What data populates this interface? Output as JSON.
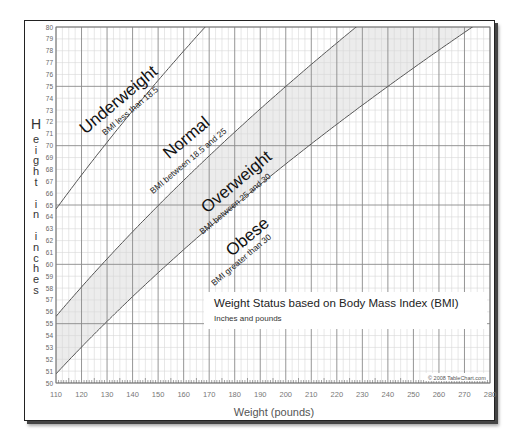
{
  "chart_data": {
    "type": "line",
    "title": "Weight Status based on Body Mass Index (BMI)",
    "subtitle": "Inches and pounds",
    "xlabel": "Weight (pounds)",
    "ylabel": "Height in inches",
    "xlim": [
      110,
      280
    ],
    "ylim": [
      50,
      80
    ],
    "x_ticks": [
      110,
      120,
      130,
      140,
      150,
      160,
      170,
      180,
      190,
      200,
      210,
      220,
      230,
      240,
      250,
      260,
      270,
      280
    ],
    "y_ticks": [
      50,
      51,
      52,
      53,
      54,
      55,
      56,
      57,
      58,
      59,
      60,
      61,
      62,
      63,
      64,
      65,
      66,
      67,
      68,
      69,
      70,
      71,
      72,
      73,
      74,
      75,
      76,
      77,
      78,
      79,
      80
    ],
    "grid": true,
    "series": [
      {
        "name": "BMI 18.5",
        "bmi": 18.5,
        "x": [
          110,
          130,
          150,
          170
        ],
        "y": [
          64.7,
          70.2,
          75.4,
          80.0
        ]
      },
      {
        "name": "BMI 25",
        "bmi": 25,
        "x": [
          110,
          150,
          200,
          250,
          255
        ],
        "y": [
          55.6,
          64.9,
          75.0,
          83.8,
          80.0
        ]
      },
      {
        "name": "BMI 30",
        "bmi": 30,
        "x": [
          110,
          150,
          200,
          250,
          273
        ],
        "y": [
          50.8,
          59.3,
          68.5,
          76.6,
          80.0
        ]
      }
    ],
    "regions": [
      {
        "label": "Underweight",
        "sublabel": "BMI less than 18.5"
      },
      {
        "label": "Normal",
        "sublabel": "BMI between 18.5 and 25"
      },
      {
        "label": "Overweight",
        "sublabel": "BMI between 25 and 30",
        "shaded": true
      },
      {
        "label": "Obese",
        "sublabel": "BMI greater than 30"
      }
    ],
    "annotations": [
      "© 2008 TableChart.com"
    ],
    "colors": {
      "line": "#555555",
      "shade": "#ececec",
      "grid_major": "#8a8a8a",
      "grid_minor": "#d6d6d6"
    }
  },
  "labels": {
    "ylabel_letters": [
      "H",
      "e",
      "i",
      "g",
      "h",
      "t",
      "",
      "i",
      "n",
      "",
      "i",
      "n",
      "c",
      "h",
      "e",
      "s"
    ],
    "copyright": "© 2008 TableChart.com"
  }
}
